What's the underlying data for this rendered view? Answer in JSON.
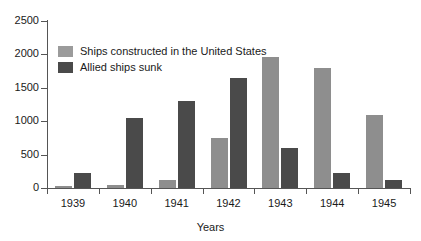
{
  "chart_data": {
    "type": "bar",
    "title": "",
    "xlabel": "Years",
    "ylabel": "",
    "categories": [
      "1939",
      "1940",
      "1941",
      "1942",
      "1943",
      "1944",
      "1945"
    ],
    "series": [
      {
        "name": "Ships constructed in the United States",
        "color": "#8e8e8e",
        "values": [
          25,
          50,
          120,
          750,
          1960,
          1790,
          1100
        ]
      },
      {
        "name": "Allied ships sunk",
        "color": "#4a4a4a",
        "values": [
          230,
          1050,
          1300,
          1650,
          600,
          220,
          120
        ]
      }
    ],
    "ylim": [
      0,
      2500
    ],
    "yticks": [
      0,
      500,
      1000,
      1500,
      2000,
      2500
    ],
    "ytick_labels": [
      "0",
      "500",
      "1000",
      "1500",
      "2000",
      "2500"
    ],
    "grid": false,
    "legend_position": "upper-left-inside"
  },
  "legend": {
    "items": [
      {
        "label": "Ships constructed in the United States",
        "swatch": "light"
      },
      {
        "label": "Allied ships sunk",
        "swatch": "dark"
      }
    ]
  },
  "colors": {
    "light_bar": "#8e8e8e",
    "dark_bar": "#4a4a4a",
    "axis": "#555555",
    "text": "#1a1a1a",
    "background": "#ffffff"
  }
}
